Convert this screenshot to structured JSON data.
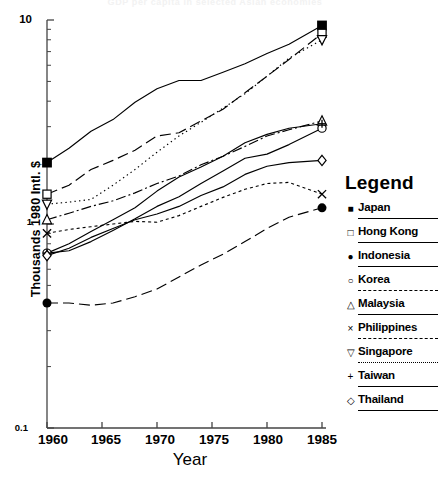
{
  "chart_data": {
    "type": "line",
    "title": "GDP per capita in selected Asian economies",
    "xlabel": "Year",
    "ylabel": "Thousands 1980 Intl. $",
    "xlim": [
      1960,
      1985
    ],
    "ylim": [
      0.1,
      10
    ],
    "yscale": "log",
    "xticks": [
      "1960",
      "1965",
      "1970",
      "1975",
      "1980",
      "1985"
    ],
    "yticks": [
      "10",
      "1",
      "0.1"
    ],
    "grid": false,
    "legend_position": "right",
    "legend_title": "Legend",
    "x": [
      1960,
      1962,
      1964,
      1966,
      1968,
      1970,
      1972,
      1974,
      1976,
      1978,
      1980,
      1982,
      1985
    ],
    "series": [
      {
        "name": "Japan",
        "marker": "filled-square",
        "marker_glyph": "■",
        "linestyle": "solid",
        "values": [
          2.0,
          2.35,
          2.85,
          3.25,
          3.95,
          4.6,
          5.05,
          5.05,
          5.55,
          6.1,
          6.85,
          7.6,
          9.4
        ]
      },
      {
        "name": "Hong Kong",
        "marker": "open-square",
        "marker_glyph": "□",
        "linestyle": "long-dash",
        "values": [
          1.4,
          1.55,
          1.85,
          2.05,
          2.3,
          2.7,
          2.8,
          3.2,
          3.65,
          4.4,
          5.3,
          6.4,
          8.6
        ]
      },
      {
        "name": "Indonesia",
        "marker": "filled-circle",
        "marker_glyph": "●",
        "linestyle": "long-dash",
        "values": [
          0.41,
          0.41,
          0.4,
          0.41,
          0.44,
          0.48,
          0.55,
          0.63,
          0.71,
          0.82,
          0.95,
          1.08,
          1.2
        ]
      },
      {
        "name": "Korea",
        "marker": "open-circle",
        "marker_glyph": "○",
        "linestyle": "solid",
        "values": [
          0.72,
          0.74,
          0.82,
          0.93,
          1.06,
          1.22,
          1.36,
          1.58,
          1.82,
          2.1,
          2.2,
          2.45,
          2.95
        ]
      },
      {
        "name": "Malaysia",
        "marker": "open-triangle-up",
        "marker_glyph": "△",
        "linestyle": "dash-dot",
        "values": [
          1.05,
          1.13,
          1.22,
          1.3,
          1.42,
          1.58,
          1.72,
          1.95,
          2.15,
          2.4,
          2.7,
          2.9,
          3.2
        ]
      },
      {
        "name": "Philippines",
        "marker": "cross",
        "marker_glyph": "×",
        "linestyle": "fine-dash",
        "values": [
          0.9,
          0.94,
          0.97,
          1.0,
          1.03,
          1.02,
          1.1,
          1.22,
          1.35,
          1.48,
          1.58,
          1.6,
          1.4
        ]
      },
      {
        "name": "Singapore",
        "marker": "open-triangle-down",
        "marker_glyph": "▽",
        "linestyle": "dotted",
        "values": [
          1.25,
          1.28,
          1.32,
          1.55,
          1.85,
          2.25,
          2.7,
          3.15,
          3.7,
          4.35,
          5.3,
          6.5,
          8.0
        ]
      },
      {
        "name": "Taiwan",
        "marker": "plus",
        "marker_glyph": "+",
        "linestyle": "solid",
        "values": [
          0.72,
          0.8,
          0.92,
          1.05,
          1.2,
          1.45,
          1.7,
          1.9,
          2.15,
          2.5,
          2.75,
          2.95,
          3.1
        ]
      },
      {
        "name": "Thailand",
        "marker": "open-diamond",
        "marker_glyph": "◇",
        "linestyle": "solid",
        "values": [
          0.7,
          0.76,
          0.86,
          0.95,
          1.05,
          1.12,
          1.22,
          1.38,
          1.52,
          1.75,
          1.92,
          2.0,
          2.05
        ]
      }
    ]
  },
  "axes": {
    "ylabel": "Thousands 1980 Intl. $",
    "xlabel": "Year",
    "ytick_top": "10",
    "ytick_mid": "1",
    "ytick_bot": "0.1",
    "xticks": [
      "1960",
      "1965",
      "1970",
      "1975",
      "1980",
      "1985"
    ]
  },
  "legend": {
    "title": "Legend",
    "items": [
      {
        "label": "Japan",
        "glyph": "■",
        "style": "solid"
      },
      {
        "label": "Hong Kong",
        "glyph": "□",
        "style": "solid"
      },
      {
        "label": "Indonesia",
        "glyph": "●",
        "style": "solid"
      },
      {
        "label": "Korea",
        "glyph": "○",
        "style": "dash-long"
      },
      {
        "label": "Malaysia",
        "glyph": "△",
        "style": "solid"
      },
      {
        "label": "Philippines",
        "glyph": "×",
        "style": "dash-med"
      },
      {
        "label": "Singapore",
        "glyph": "▽",
        "style": "dotted"
      },
      {
        "label": "Taiwan",
        "glyph": "+",
        "style": "solid"
      },
      {
        "label": "Thailand",
        "glyph": "◇",
        "style": "solid"
      }
    ]
  }
}
